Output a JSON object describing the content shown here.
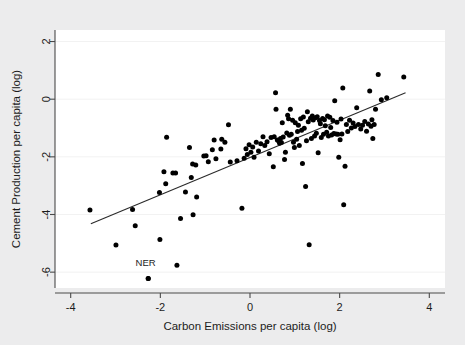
{
  "chart_data": {
    "type": "scatter",
    "title": "",
    "xlabel": "Carbon Emissions per capita (log)",
    "ylabel": "Cement Production per capita (log)",
    "xlim": [
      -4.35,
      4.35
    ],
    "ylim": [
      -6.55,
      2.4
    ],
    "xticks": [
      -4,
      -2,
      0,
      2,
      4
    ],
    "xticklabels": [
      "-4",
      "-2",
      "0",
      "2",
      "4"
    ],
    "yticks": [
      2,
      0,
      -2,
      -4,
      -6
    ],
    "yticklabels": [
      "2",
      "0",
      "-2",
      "-4",
      "-6"
    ],
    "grid": true,
    "grid_axis": "y",
    "legend": "none",
    "point_color": "#000000",
    "fitline_color": "#2a2a2a",
    "background_color": "#ececed",
    "plot_background_color": "#ffffff",
    "annotations": [
      {
        "text": "NER",
        "x": -2.33,
        "y": -5.78,
        "point_x": -2.27,
        "point_y": -6.22
      }
    ],
    "fit_line": {
      "x_start": -3.55,
      "y_start": -4.32,
      "x_end": 3.47,
      "y_end": 0.22
    },
    "points": [
      [
        -3.57,
        -3.84
      ],
      [
        -2.99,
        -5.06
      ],
      [
        -2.62,
        -3.83
      ],
      [
        -2.56,
        -4.39
      ],
      [
        -2.27,
        -6.22
      ],
      [
        -2.02,
        -3.24
      ],
      [
        -2.01,
        -4.87
      ],
      [
        -1.92,
        -2.52
      ],
      [
        -1.88,
        -2.93
      ],
      [
        -1.86,
        -1.32
      ],
      [
        -1.72,
        -2.56
      ],
      [
        -1.66,
        -2.56
      ],
      [
        -1.63,
        -5.76
      ],
      [
        -1.55,
        -4.14
      ],
      [
        -1.44,
        -3.22
      ],
      [
        -1.35,
        -1.68
      ],
      [
        -1.31,
        -2.72
      ],
      [
        -1.28,
        -2.25
      ],
      [
        -1.27,
        -4.01
      ],
      [
        -1.21,
        -2.28
      ],
      [
        -1.19,
        -3.39
      ],
      [
        -1.03,
        -1.97
      ],
      [
        -0.98,
        -1.96
      ],
      [
        -0.93,
        -2.17
      ],
      [
        -0.84,
        -1.75
      ],
      [
        -0.8,
        -1.42
      ],
      [
        -0.76,
        -2.07
      ],
      [
        -0.65,
        -1.73
      ],
      [
        -0.63,
        -1.39
      ],
      [
        -0.56,
        -1.49
      ],
      [
        -0.48,
        -0.89
      ],
      [
        -0.44,
        -2.18
      ],
      [
        -0.29,
        -2.14
      ],
      [
        -0.18,
        -3.78
      ],
      [
        -0.13,
        -2.05
      ],
      [
        -0.09,
        -1.72
      ],
      [
        -0.06,
        -1.92
      ],
      [
        -0.02,
        -1.58
      ],
      [
        0.02,
        -1.84
      ],
      [
        0.06,
        -1.66
      ],
      [
        0.09,
        -2.01
      ],
      [
        0.14,
        -1.49
      ],
      [
        0.19,
        -1.8
      ],
      [
        0.24,
        -1.55
      ],
      [
        0.29,
        -1.3
      ],
      [
        0.33,
        -1.61
      ],
      [
        0.38,
        -1.48
      ],
      [
        0.43,
        -1.89
      ],
      [
        0.47,
        -1.33
      ],
      [
        0.52,
        -2.34
      ],
      [
        0.54,
        -1.3
      ],
      [
        0.57,
        0.22
      ],
      [
        0.58,
        -0.35
      ],
      [
        0.61,
        -1.42
      ],
      [
        0.64,
        -1.45
      ],
      [
        0.66,
        -1.53
      ],
      [
        0.68,
        -1.36
      ],
      [
        0.7,
        -1.5
      ],
      [
        0.72,
        -0.82
      ],
      [
        0.74,
        -1.31
      ],
      [
        0.77,
        -2.09
      ],
      [
        0.79,
        -1.84
      ],
      [
        0.82,
        -1.17
      ],
      [
        0.84,
        -0.56
      ],
      [
        0.86,
        -0.68
      ],
      [
        0.88,
        -1.25
      ],
      [
        0.9,
        -0.35
      ],
      [
        0.92,
        -1.22
      ],
      [
        0.95,
        -0.73
      ],
      [
        0.97,
        -1.49
      ],
      [
        0.99,
        -1.68
      ],
      [
        1.01,
        -0.82
      ],
      [
        1.04,
        -1.39
      ],
      [
        1.06,
        -1.12
      ],
      [
        1.08,
        -0.9
      ],
      [
        1.1,
        -1.61
      ],
      [
        1.13,
        -0.68
      ],
      [
        1.15,
        -1.08
      ],
      [
        1.17,
        -2.23
      ],
      [
        1.19,
        -0.62
      ],
      [
        1.21,
        -1.01
      ],
      [
        1.24,
        -3.03
      ],
      [
        1.26,
        -1.44
      ],
      [
        1.28,
        -0.44
      ],
      [
        1.3,
        -0.78
      ],
      [
        1.32,
        -5.05
      ],
      [
        1.35,
        -0.66
      ],
      [
        1.37,
        -1.36
      ],
      [
        1.39,
        -0.58
      ],
      [
        1.41,
        -0.72
      ],
      [
        1.44,
        -1.28
      ],
      [
        1.46,
        -0.64
      ],
      [
        1.48,
        -1.18
      ],
      [
        1.5,
        -0.61
      ],
      [
        1.52,
        -1.86
      ],
      [
        1.55,
        -0.74
      ],
      [
        1.57,
        -0.85
      ],
      [
        1.59,
        -1.33
      ],
      [
        1.62,
        -0.67
      ],
      [
        1.64,
        -1.22
      ],
      [
        1.66,
        -0.71
      ],
      [
        1.68,
        -0.92
      ],
      [
        1.71,
        -1.15
      ],
      [
        1.73,
        -0.58
      ],
      [
        1.75,
        -1.28
      ],
      [
        1.78,
        -0.63
      ],
      [
        1.8,
        -0.98
      ],
      [
        1.82,
        -1.24
      ],
      [
        1.85,
        -0.74
      ],
      [
        1.87,
        -1.19
      ],
      [
        1.89,
        -0.05
      ],
      [
        1.92,
        -1.21
      ],
      [
        1.94,
        -0.8
      ],
      [
        1.96,
        -1.22
      ],
      [
        1.98,
        -2.01
      ],
      [
        2.01,
        -1.41
      ],
      [
        2.03,
        -0.69
      ],
      [
        2.05,
        -1.21
      ],
      [
        2.07,
        0.39
      ],
      [
        2.09,
        -3.66
      ],
      [
        2.12,
        -2.33
      ],
      [
        2.15,
        -0.88
      ],
      [
        2.18,
        -1.12
      ],
      [
        2.22,
        -0.73
      ],
      [
        2.26,
        -1.0
      ],
      [
        2.3,
        -0.83
      ],
      [
        2.34,
        -0.95
      ],
      [
        2.38,
        -0.3
      ],
      [
        2.42,
        -0.88
      ],
      [
        2.47,
        -1.03
      ],
      [
        2.51,
        -0.9
      ],
      [
        2.56,
        -0.77
      ],
      [
        2.6,
        -1.11
      ],
      [
        2.64,
        -0.86
      ],
      [
        2.67,
        0.28
      ],
      [
        2.7,
        -0.94
      ],
      [
        2.72,
        -0.71
      ],
      [
        2.74,
        -1.36
      ],
      [
        2.77,
        -0.88
      ],
      [
        2.8,
        -0.35
      ],
      [
        2.86,
        0.86
      ],
      [
        2.93,
        -0.02
      ],
      [
        3.05,
        0.05
      ],
      [
        3.43,
        0.77
      ]
    ]
  }
}
